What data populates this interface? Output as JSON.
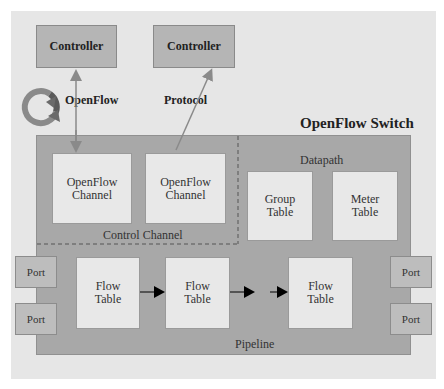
{
  "title": "OpenFlow Switch",
  "controllers": [
    {
      "label": "Controller"
    },
    {
      "label": "Controller"
    }
  ],
  "connection_labels": {
    "left": "OpenFlow",
    "right": "Protocol"
  },
  "control_channel": {
    "label": "Control Channel",
    "channels": [
      {
        "line1": "OpenFlow",
        "line2": "Channel"
      },
      {
        "line1": "OpenFlow",
        "line2": "Channel"
      }
    ]
  },
  "datapath": {
    "label": "Datapath",
    "tables": [
      {
        "line1": "Group",
        "line2": "Table"
      },
      {
        "line1": "Meter",
        "line2": "Table"
      }
    ]
  },
  "pipeline": {
    "label": "Pipeline",
    "flow_tables": [
      {
        "line1": "Flow",
        "line2": "Table"
      },
      {
        "line1": "Flow",
        "line2": "Table"
      },
      {
        "line1": "Flow",
        "line2": "Table"
      }
    ]
  },
  "ports": {
    "left": [
      {
        "label": "Port"
      },
      {
        "label": "Port"
      }
    ],
    "right": [
      {
        "label": "Port"
      },
      {
        "label": "Port"
      }
    ]
  },
  "icons": {
    "cycle": "circular-arrows-icon"
  },
  "colors": {
    "background": "#e6e6e6",
    "switch": "#a8a8a8",
    "controller": "#b5b5b5",
    "inner_box": "#e8e8e8",
    "port": "#bdbdbd",
    "arrow": "#000000",
    "link_line": "#8a8a8a"
  }
}
